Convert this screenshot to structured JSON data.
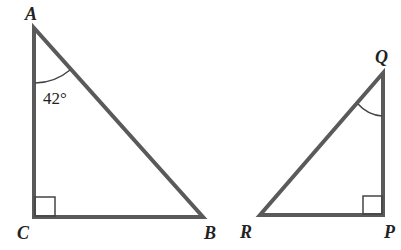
{
  "diagram": {
    "type": "two right triangles",
    "colors": {
      "stroke": "#5a5a5a",
      "text": "#222222",
      "background": "#ffffff"
    },
    "triangle1": {
      "vertices": {
        "A": "A",
        "B": "B",
        "C": "C"
      },
      "angle_A_label": "42°",
      "right_angle_at": "C"
    },
    "triangle2": {
      "vertices": {
        "P": "P",
        "Q": "Q",
        "R": "R"
      },
      "angle_Q_marked": true,
      "right_angle_at": "P"
    }
  }
}
